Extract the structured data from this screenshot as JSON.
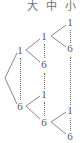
{
  "diagram": {
    "type": "probability-tree",
    "columns": [
      {
        "id": "large",
        "label": "大",
        "meaning": "large"
      },
      {
        "id": "medium",
        "label": "中",
        "meaning": "medium"
      },
      {
        "id": "small",
        "label": "小",
        "meaning": "small"
      }
    ],
    "branch_range": {
      "first": "1",
      "last": "6",
      "ellipsis": "⋮"
    },
    "stroke_color": "#8a8a8a",
    "text_color": "#585858",
    "header_color": "#6f6f6f",
    "background": "#ffffff",
    "root": {
      "x": 5,
      "y": 78
    },
    "groups": [
      {
        "id": "group-large",
        "column": "large",
        "parent": "root",
        "top": {
          "value": "1",
          "x": 18,
          "y": 50
        },
        "bottom": {
          "value": "6",
          "x": 18,
          "y": 106
        }
      },
      {
        "id": "group-medium-from-1",
        "column": "medium",
        "parent": "group-large-top",
        "top": {
          "value": "1",
          "x": 42,
          "y": 36
        },
        "bottom": {
          "value": "6",
          "x": 42,
          "y": 64
        }
      },
      {
        "id": "group-medium-from-6",
        "column": "medium",
        "parent": "group-large-bottom",
        "top": {
          "value": "1",
          "x": 42,
          "y": 94
        },
        "bottom": {
          "value": "6",
          "x": 42,
          "y": 122
        }
      },
      {
        "id": "group-small-from-medium-1",
        "column": "small",
        "parent": "group-medium-from-1-top",
        "top": {
          "value": "1",
          "x": 68,
          "y": 22
        },
        "bottom": {
          "value": "6",
          "x": 68,
          "y": 48
        }
      },
      {
        "id": "group-small-from-medium-6",
        "column": "small",
        "parent": "group-medium-from-6-bottom",
        "top": {
          "value": "1",
          "x": 68,
          "y": 110
        },
        "bottom": {
          "value": "6",
          "x": 68,
          "y": 136
        }
      }
    ]
  }
}
